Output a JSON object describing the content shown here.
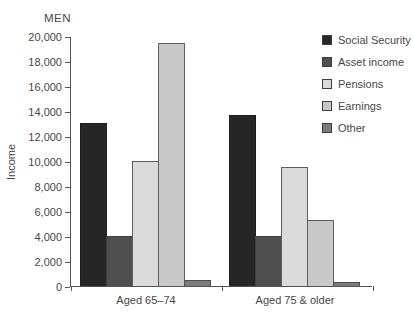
{
  "chart_data": {
    "type": "bar",
    "title": "MEN",
    "ylabel": "Income",
    "xlabel": "",
    "categories": [
      "Aged 65–74",
      "Aged 75 & older"
    ],
    "series": [
      {
        "name": "Social Security",
        "color": "#262626",
        "border": "#1f1f1f",
        "values": [
          13000,
          13700
        ]
      },
      {
        "name": "Asset income",
        "color": "#4f4f4f",
        "border": "#3f3f3f",
        "values": [
          4000,
          4000
        ]
      },
      {
        "name": "Pensions",
        "color": "#dadada",
        "border": "#5f5f5f",
        "values": [
          10000,
          9500
        ]
      },
      {
        "name": "Earnings",
        "color": "#c8c8c8",
        "border": "#5f5f5f",
        "values": [
          19400,
          5300
        ]
      },
      {
        "name": "Other",
        "color": "#7b7b7b",
        "border": "#4f4f4f",
        "values": [
          500,
          300
        ]
      }
    ],
    "ylim": [
      0,
      20000
    ],
    "ytick_step": 2000,
    "ytick_labels": [
      "0",
      "2,000",
      "4,000",
      "6,000",
      "8,000",
      "10,000",
      "12,000",
      "14,000",
      "16,000",
      "18,000",
      "20,000"
    ],
    "legend_position": "right",
    "grid": false
  }
}
